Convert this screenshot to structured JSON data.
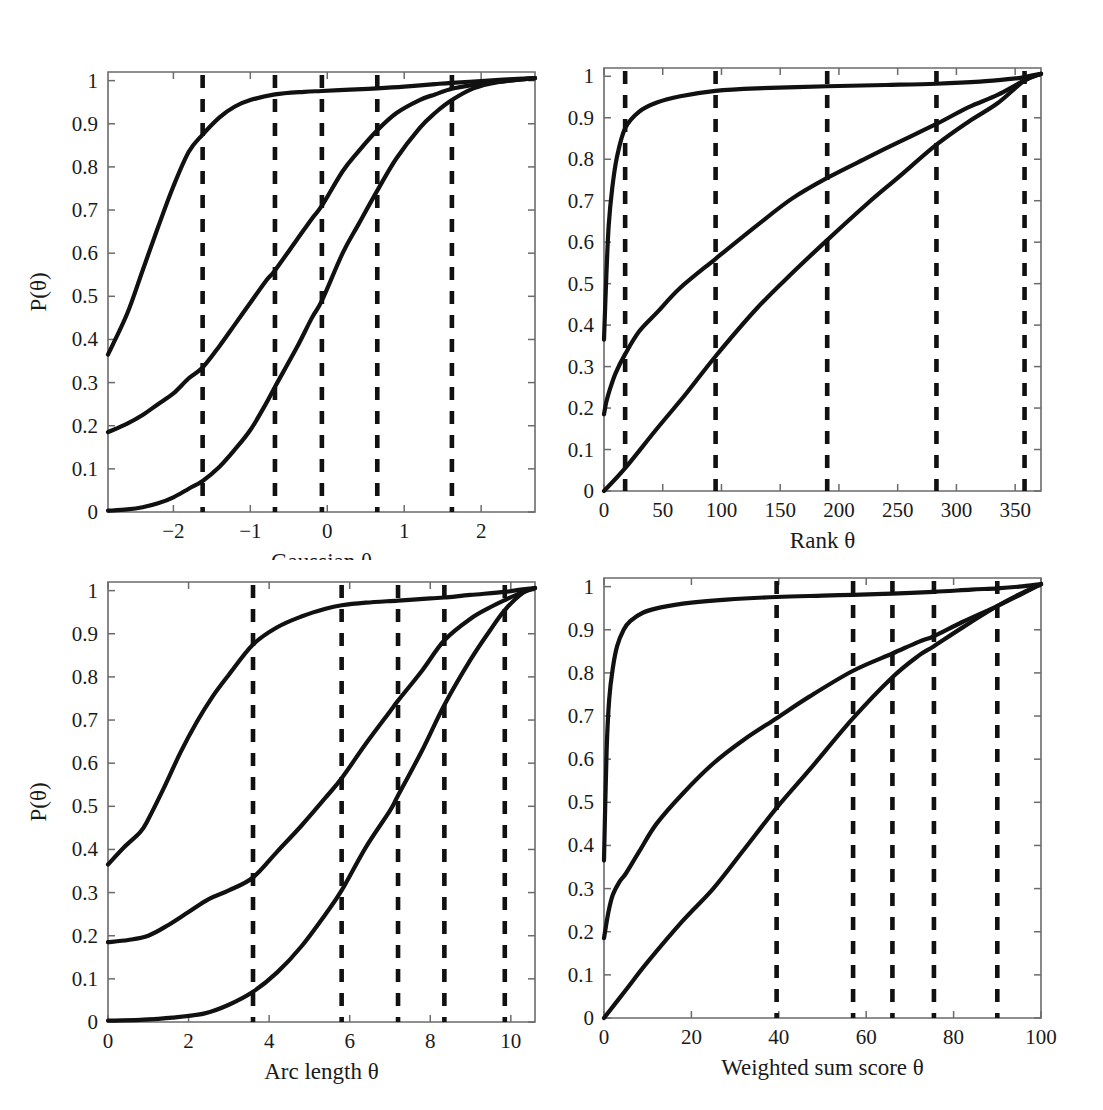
{
  "figure": {
    "background": "#ffffff",
    "curve_color": "#111111",
    "axis_color": "#6b6b6b",
    "cutline_color": "#111111",
    "ylabel": "P(θ)",
    "panel_count": 4
  },
  "chart_data": [
    {
      "type": "line",
      "id": "gaussian",
      "title": "",
      "xlabel": "Gaussian θ",
      "ylabel": "P(θ)",
      "xlim": [
        -2.85,
        2.7
      ],
      "ylim": [
        0,
        1.02
      ],
      "xticks": [
        -2,
        -1,
        0,
        1,
        2
      ],
      "xticklabels": [
        "−2",
        "−1",
        "0",
        "1",
        "2"
      ],
      "yticks": [
        0,
        0.1,
        0.2,
        0.3,
        0.4,
        0.5,
        0.6,
        0.7,
        0.8,
        0.9,
        1
      ],
      "yticklabels": [
        "0",
        "0.1",
        "0.2",
        "0.3",
        "0.4",
        "0.5",
        "0.6",
        "0.7",
        "0.8",
        "0.9",
        "1"
      ],
      "grid": false,
      "legend": "none",
      "cut_lines": [
        -1.62,
        -0.68,
        -0.07,
        0.65,
        1.62
      ],
      "series": [
        {
          "name": "curve-1",
          "x": [
            -2.85,
            -2.6,
            -2.4,
            -2.2,
            -2.0,
            -1.8,
            -1.62,
            -1.4,
            -1.2,
            -1.0,
            -0.68,
            -0.3,
            -0.07,
            0.3,
            0.65,
            1.0,
            1.4,
            1.62,
            2.0,
            2.35,
            2.7
          ],
          "values": [
            0.365,
            0.46,
            0.56,
            0.66,
            0.755,
            0.835,
            0.875,
            0.915,
            0.94,
            0.955,
            0.968,
            0.974,
            0.976,
            0.979,
            0.982,
            0.986,
            0.992,
            0.995,
            0.999,
            1.003,
            1.006
          ]
        },
        {
          "name": "curve-2",
          "x": [
            -2.85,
            -2.6,
            -2.4,
            -2.2,
            -2.0,
            -1.8,
            -1.62,
            -1.4,
            -1.2,
            -1.0,
            -0.8,
            -0.68,
            -0.4,
            -0.2,
            -0.07,
            0.2,
            0.4,
            0.65,
            0.9,
            1.2,
            1.4,
            1.62,
            1.9,
            2.2,
            2.7
          ],
          "values": [
            0.185,
            0.205,
            0.225,
            0.25,
            0.275,
            0.31,
            0.335,
            0.385,
            0.435,
            0.485,
            0.535,
            0.56,
            0.63,
            0.68,
            0.71,
            0.79,
            0.835,
            0.885,
            0.925,
            0.955,
            0.968,
            0.981,
            0.99,
            0.997,
            1.006
          ]
        },
        {
          "name": "curve-3",
          "x": [
            -2.85,
            -2.6,
            -2.4,
            -2.2,
            -2.0,
            -1.8,
            -1.62,
            -1.4,
            -1.2,
            -1.0,
            -0.8,
            -0.68,
            -0.4,
            -0.2,
            -0.07,
            0.2,
            0.4,
            0.65,
            0.9,
            1.2,
            1.4,
            1.62,
            1.9,
            2.2,
            2.7
          ],
          "values": [
            0.003,
            0.006,
            0.011,
            0.02,
            0.034,
            0.054,
            0.072,
            0.105,
            0.145,
            0.19,
            0.25,
            0.29,
            0.38,
            0.45,
            0.49,
            0.6,
            0.665,
            0.745,
            0.82,
            0.89,
            0.925,
            0.955,
            0.982,
            0.996,
            1.006
          ]
        }
      ]
    },
    {
      "type": "line",
      "id": "rank",
      "title": "",
      "xlabel": "Rank θ",
      "ylabel": "P(θ)",
      "xlim": [
        0,
        372
      ],
      "ylim": [
        0,
        1.02
      ],
      "xticks": [
        0,
        50,
        100,
        150,
        200,
        250,
        300,
        350
      ],
      "xticklabels": [
        "0",
        "50",
        "100",
        "150",
        "200",
        "250",
        "300",
        "350"
      ],
      "yticks": [
        0,
        0.1,
        0.2,
        0.3,
        0.4,
        0.5,
        0.6,
        0.7,
        0.8,
        0.9,
        1
      ],
      "yticklabels": [
        "0",
        "0.1",
        "0.2",
        "0.3",
        "0.4",
        "0.5",
        "0.6",
        "0.7",
        "0.8",
        "0.9",
        "1"
      ],
      "grid": false,
      "legend": "none",
      "cut_lines": [
        18,
        95,
        190,
        283,
        358
      ],
      "series": [
        {
          "name": "curve-1",
          "x": [
            0,
            2,
            4,
            7,
            11,
            18,
            30,
            45,
            65,
            95,
            130,
            190,
            240,
            283,
            320,
            350,
            358,
            366,
            372
          ],
          "values": [
            0.365,
            0.52,
            0.64,
            0.73,
            0.805,
            0.875,
            0.915,
            0.937,
            0.952,
            0.965,
            0.971,
            0.976,
            0.979,
            0.982,
            0.987,
            0.995,
            0.998,
            1.003,
            1.006
          ]
        },
        {
          "name": "curve-2",
          "x": [
            0,
            2,
            5,
            10,
            18,
            30,
            45,
            65,
            95,
            130,
            160,
            190,
            225,
            250,
            283,
            310,
            335,
            358,
            372
          ],
          "values": [
            0.185,
            0.215,
            0.245,
            0.285,
            0.33,
            0.385,
            0.43,
            0.49,
            0.56,
            0.64,
            0.705,
            0.755,
            0.805,
            0.84,
            0.885,
            0.925,
            0.955,
            0.99,
            1.006
          ]
        },
        {
          "name": "curve-3",
          "x": [
            0,
            18,
            45,
            70,
            95,
            130,
            160,
            190,
            225,
            250,
            283,
            310,
            335,
            358,
            372
          ],
          "values": [
            0.0,
            0.055,
            0.15,
            0.235,
            0.325,
            0.44,
            0.525,
            0.605,
            0.695,
            0.755,
            0.835,
            0.89,
            0.935,
            0.99,
            1.006
          ]
        }
      ]
    },
    {
      "type": "line",
      "id": "arc-length",
      "title": "",
      "xlabel": "Arc length θ",
      "ylabel": "P(θ)",
      "xlim": [
        0,
        10.6
      ],
      "ylim": [
        0,
        1.02
      ],
      "xticks": [
        0,
        2,
        4,
        6,
        8,
        10
      ],
      "xticklabels": [
        "0",
        "2",
        "4",
        "6",
        "8",
        "10"
      ],
      "yticks": [
        0,
        0.1,
        0.2,
        0.3,
        0.4,
        0.5,
        0.6,
        0.7,
        0.8,
        0.9,
        1
      ],
      "yticklabels": [
        "0",
        "0.1",
        "0.2",
        "0.3",
        "0.4",
        "0.5",
        "0.6",
        "0.7",
        "0.8",
        "0.9",
        "1"
      ],
      "grid": false,
      "legend": "none",
      "cut_lines": [
        3.6,
        5.8,
        7.2,
        8.35,
        9.85
      ],
      "series": [
        {
          "name": "curve-1",
          "x": [
            0,
            0.4,
            0.8,
            1.0,
            1.4,
            1.8,
            2.2,
            2.6,
            3.0,
            3.6,
            4.2,
            4.8,
            5.4,
            5.8,
            6.4,
            7.2,
            8.0,
            8.35,
            9.0,
            9.85,
            10.3,
            10.6
          ],
          "values": [
            0.365,
            0.405,
            0.44,
            0.47,
            0.545,
            0.625,
            0.695,
            0.755,
            0.805,
            0.875,
            0.915,
            0.94,
            0.958,
            0.966,
            0.972,
            0.977,
            0.982,
            0.984,
            0.99,
            0.997,
            1.003,
            1.006
          ]
        },
        {
          "name": "curve-2",
          "x": [
            0,
            0.5,
            1.0,
            1.5,
            2.0,
            2.5,
            3.0,
            3.6,
            4.2,
            4.8,
            5.4,
            5.8,
            6.4,
            7.0,
            7.2,
            7.8,
            8.35,
            9.0,
            9.5,
            9.85,
            10.3,
            10.6
          ],
          "values": [
            0.185,
            0.19,
            0.2,
            0.225,
            0.255,
            0.285,
            0.305,
            0.335,
            0.395,
            0.455,
            0.52,
            0.565,
            0.645,
            0.72,
            0.745,
            0.815,
            0.885,
            0.935,
            0.962,
            0.978,
            0.997,
            1.006
          ]
        },
        {
          "name": "curve-3",
          "x": [
            0,
            0.8,
            1.6,
            2.4,
            3.0,
            3.6,
            4.2,
            4.8,
            5.4,
            5.8,
            6.4,
            7.0,
            7.2,
            7.8,
            8.35,
            9.0,
            9.5,
            9.85,
            10.3,
            10.6
          ],
          "values": [
            0.003,
            0.005,
            0.01,
            0.02,
            0.04,
            0.07,
            0.115,
            0.175,
            0.25,
            0.305,
            0.405,
            0.49,
            0.525,
            0.63,
            0.735,
            0.84,
            0.91,
            0.955,
            0.995,
            1.006
          ]
        }
      ]
    },
    {
      "type": "line",
      "id": "weighted-sum-score",
      "title": "",
      "xlabel": "Weighted sum score θ",
      "ylabel": "P(θ)",
      "xlim": [
        0,
        100
      ],
      "ylim": [
        0,
        1.02
      ],
      "xticks": [
        0,
        20,
        40,
        60,
        80,
        100
      ],
      "xticklabels": [
        "0",
        "20",
        "40",
        "60",
        "80",
        "100"
      ],
      "yticks": [
        0,
        0.1,
        0.2,
        0.3,
        0.4,
        0.5,
        0.6,
        0.7,
        0.8,
        0.9,
        1
      ],
      "yticklabels": [
        "0",
        "0.1",
        "0.2",
        "0.3",
        "0.4",
        "0.5",
        "0.6",
        "0.7",
        "0.8",
        "0.9",
        "1"
      ],
      "grid": false,
      "legend": "none",
      "cut_lines": [
        39.5,
        57,
        66,
        75.5,
        90
      ],
      "series": [
        {
          "name": "curve-1",
          "x": [
            0,
            0.6,
            1.2,
            2,
            3,
            4.5,
            6,
            9,
            13,
            20,
            28,
            39.5,
            50,
            57,
            66,
            75.5,
            84,
            90,
            95,
            100
          ],
          "values": [
            0.365,
            0.62,
            0.74,
            0.81,
            0.862,
            0.9,
            0.92,
            0.94,
            0.952,
            0.963,
            0.97,
            0.976,
            0.979,
            0.981,
            0.984,
            0.988,
            0.993,
            0.996,
            1.0,
            1.006
          ]
        },
        {
          "name": "curve-2",
          "x": [
            0,
            1,
            2,
            3.5,
            5,
            8,
            12,
            18,
            25,
            32,
            39.5,
            47,
            57,
            66,
            72,
            75.5,
            82,
            90,
            95,
            100
          ],
          "values": [
            0.185,
            0.245,
            0.285,
            0.315,
            0.335,
            0.385,
            0.45,
            0.52,
            0.59,
            0.645,
            0.695,
            0.745,
            0.805,
            0.845,
            0.872,
            0.885,
            0.918,
            0.955,
            0.98,
            1.006
          ]
        },
        {
          "name": "curve-3",
          "x": [
            0,
            5,
            10,
            18,
            25,
            32,
            39.5,
            47,
            57,
            66,
            72,
            75.5,
            82,
            90,
            95,
            100
          ],
          "values": [
            0.0,
            0.065,
            0.13,
            0.225,
            0.3,
            0.39,
            0.487,
            0.575,
            0.695,
            0.79,
            0.84,
            0.862,
            0.905,
            0.955,
            0.982,
            1.006
          ]
        }
      ]
    }
  ]
}
